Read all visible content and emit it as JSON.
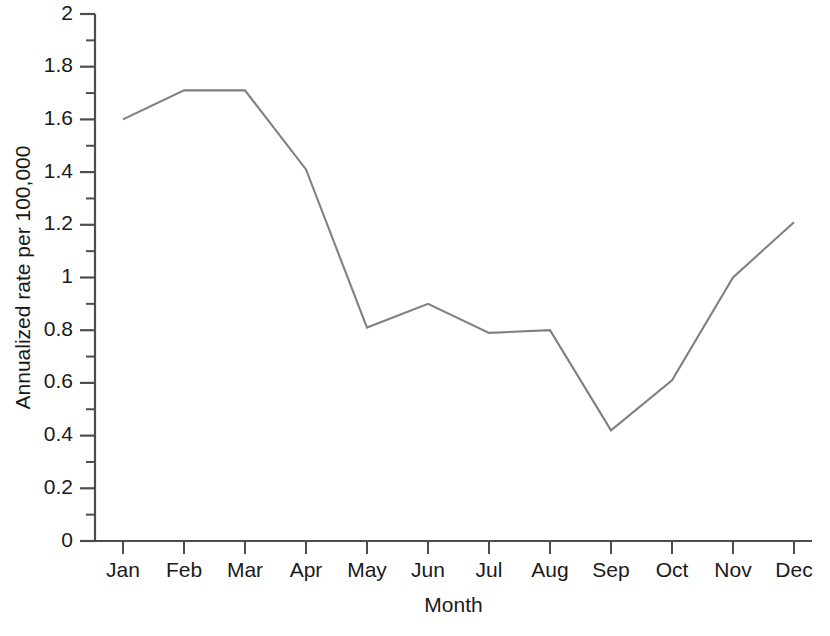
{
  "chart_data": {
    "type": "line",
    "title": "",
    "subtitle": "",
    "xlabel": "Month",
    "ylabel": "Annualized rate per 100,000",
    "categories": [
      "Jan",
      "Feb",
      "Mar",
      "Apr",
      "May",
      "Jun",
      "Jul",
      "Aug",
      "Sep",
      "Oct",
      "Nov",
      "Dec"
    ],
    "values": [
      1.6,
      1.71,
      1.71,
      1.41,
      0.81,
      0.9,
      0.79,
      0.8,
      0.42,
      0.61,
      1.0,
      1.21
    ],
    "series": [
      {
        "name": "Annualized rate",
        "values": [
          1.6,
          1.71,
          1.71,
          1.41,
          0.81,
          0.9,
          0.79,
          0.8,
          0.42,
          0.61,
          1.0,
          1.21
        ],
        "color": "#808080"
      }
    ],
    "ylim": [
      0,
      2
    ],
    "xlim": [
      0,
      13
    ],
    "y_ticks": [
      0,
      0.2,
      0.4,
      0.6,
      0.8,
      1,
      1.2,
      1.4,
      1.6,
      1.8,
      2
    ],
    "y_tick_labels": [
      "0",
      "0.2",
      "0.4",
      "0.6",
      "0.8",
      "1",
      "1.2",
      "1.4",
      "1.6",
      "1.8",
      "2"
    ],
    "y_minor_tick_interval": 0.1,
    "x_tick_labels": [
      "Jan",
      "Feb",
      "Mar",
      "Apr",
      "May",
      "Jun",
      "Jul",
      "Aug",
      "Sep",
      "Oct",
      "Nov",
      "Dec"
    ],
    "grid": false,
    "legend": "none",
    "markers": "none",
    "axis_color": "#4d4d4d",
    "line_color": "#808080",
    "background_color": "#ffffff"
  },
  "axes": {
    "y_title": "Annualized rate per 100,000",
    "x_title": "Month"
  }
}
